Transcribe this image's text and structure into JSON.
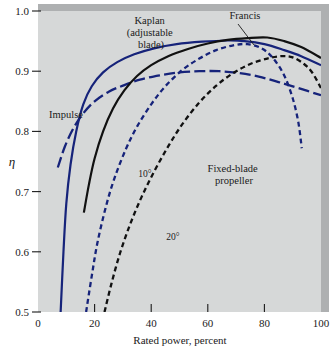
{
  "chart_data": {
    "type": "line",
    "title": "",
    "xlabel": "Rated power, percent",
    "ylabel": "η",
    "xlim": [
      0,
      100
    ],
    "ylim": [
      0.5,
      1.0
    ],
    "grid": false,
    "legend": "none",
    "xticks": [
      0,
      20,
      40,
      60,
      80,
      100
    ],
    "xtick_labels": [
      "0",
      "20",
      "40",
      "60",
      "80",
      "100"
    ],
    "yticks": [
      0.5,
      0.6,
      0.7,
      0.8,
      0.9,
      1.0
    ],
    "ytick_labels": [
      "0.5",
      "0.6",
      "0.7",
      "0.8",
      "0.9",
      "1.0"
    ],
    "series": [
      {
        "name": "Kaplan (adjustable blade)",
        "color": "#16237a",
        "style": "solid",
        "label_lines": [
          "Kaplan",
          "(adjustable",
          "blade)"
        ],
        "points": [
          [
            8.0,
            0.5
          ],
          [
            9.0,
            0.6
          ],
          [
            10.0,
            0.68
          ],
          [
            11.5,
            0.745
          ],
          [
            13.5,
            0.8
          ],
          [
            16.0,
            0.845
          ],
          [
            19.0,
            0.875
          ],
          [
            23.0,
            0.898
          ],
          [
            28.0,
            0.915
          ],
          [
            34.0,
            0.928
          ],
          [
            41.0,
            0.938
          ],
          [
            49.0,
            0.945
          ],
          [
            58.0,
            0.949
          ],
          [
            67.0,
            0.951
          ],
          [
            73.0,
            0.95
          ],
          [
            80.0,
            0.945
          ],
          [
            87.0,
            0.935
          ],
          [
            93.0,
            0.925
          ],
          [
            100.0,
            0.91
          ]
        ]
      },
      {
        "name": "Francis",
        "color": "#111111",
        "style": "solid",
        "label_lines": [
          "Francis"
        ],
        "points": [
          [
            16.2,
            0.665
          ],
          [
            18.0,
            0.712
          ],
          [
            20.0,
            0.755
          ],
          [
            23.0,
            0.8
          ],
          [
            26.5,
            0.838
          ],
          [
            30.5,
            0.868
          ],
          [
            35.0,
            0.892
          ],
          [
            40.0,
            0.91
          ],
          [
            46.0,
            0.925
          ],
          [
            53.0,
            0.937
          ],
          [
            60.0,
            0.946
          ],
          [
            67.0,
            0.952
          ],
          [
            74.0,
            0.955
          ],
          [
            81.0,
            0.956
          ],
          [
            87.0,
            0.95
          ],
          [
            93.0,
            0.94
          ],
          [
            100.0,
            0.922
          ]
        ]
      },
      {
        "name": "Impulse",
        "color": "#16237a",
        "style": "dash-long",
        "label_lines": [
          "Impulse"
        ],
        "points": [
          [
            7.0,
            0.74
          ],
          [
            9.5,
            0.775
          ],
          [
            12.5,
            0.805
          ],
          [
            16.0,
            0.83
          ],
          [
            20.0,
            0.85
          ],
          [
            25.0,
            0.866
          ],
          [
            30.0,
            0.876
          ],
          [
            36.0,
            0.886
          ],
          [
            43.0,
            0.893
          ],
          [
            50.0,
            0.898
          ],
          [
            57.0,
            0.9
          ],
          [
            64.0,
            0.9
          ],
          [
            71.0,
            0.897
          ],
          [
            78.0,
            0.891
          ],
          [
            85.0,
            0.882
          ],
          [
            92.0,
            0.872
          ],
          [
            100.0,
            0.86
          ]
        ]
      },
      {
        "name": "10°",
        "color": "#16237a",
        "style": "dash-short",
        "label_lines": [
          "10°"
        ],
        "points": [
          [
            17.0,
            0.5
          ],
          [
            19.0,
            0.56
          ],
          [
            21.0,
            0.615
          ],
          [
            24.0,
            0.675
          ],
          [
            27.0,
            0.722
          ],
          [
            31.0,
            0.77
          ],
          [
            35.0,
            0.808
          ],
          [
            40.0,
            0.845
          ],
          [
            45.0,
            0.875
          ],
          [
            51.0,
            0.902
          ],
          [
            57.0,
            0.921
          ],
          [
            63.0,
            0.935
          ],
          [
            69.0,
            0.943
          ],
          [
            74.0,
            0.945
          ],
          [
            79.0,
            0.938
          ],
          [
            83.0,
            0.922
          ],
          [
            87.0,
            0.893
          ],
          [
            90.0,
            0.855
          ],
          [
            92.0,
            0.815
          ],
          [
            93.2,
            0.772
          ]
        ]
      },
      {
        "name": "Fixed-blade propeller (20°)",
        "color": "#111111",
        "style": "dash-short",
        "label_lines": [
          "Fixed-blade",
          "propeller"
        ],
        "secondary_label": "20°",
        "points": [
          [
            23.5,
            0.5
          ],
          [
            26.0,
            0.548
          ],
          [
            29.0,
            0.598
          ],
          [
            32.5,
            0.645
          ],
          [
            36.5,
            0.69
          ],
          [
            41.0,
            0.733
          ],
          [
            46.0,
            0.775
          ],
          [
            51.0,
            0.812
          ],
          [
            57.0,
            0.848
          ],
          [
            63.0,
            0.876
          ],
          [
            69.0,
            0.897
          ],
          [
            75.0,
            0.912
          ],
          [
            81.0,
            0.921
          ],
          [
            86.0,
            0.925
          ],
          [
            90.0,
            0.923
          ],
          [
            94.0,
            0.912
          ],
          [
            97.0,
            0.897
          ],
          [
            100.0,
            0.872
          ]
        ]
      }
    ],
    "annotations": [
      {
        "name": "kaplan-label",
        "text_lines": [
          "Kaplan",
          "(adjustable",
          "blade)"
        ],
        "x_px": 151,
        "y_px": 24
      },
      {
        "name": "francis-label",
        "text_lines": [
          "Francis"
        ],
        "x_px": 245,
        "y_px": 17,
        "leader": {
          "x1": 238,
          "y1": 23,
          "x2": 253,
          "y2": 44
        }
      },
      {
        "name": "impulse-label",
        "text_lines": [
          "Impulse"
        ],
        "x_px": 66,
        "y_px": 115
      },
      {
        "name": "ten-degree-label",
        "text_lines": [
          "10°"
        ],
        "x_px": 145,
        "y_px": 174
      },
      {
        "name": "twenty-degree-label",
        "text_lines": [
          "20°"
        ],
        "x_px": 173,
        "y_px": 237
      },
      {
        "name": "fixed-blade-propeller-label",
        "text_lines": [
          "Fixed-blade",
          "propeller"
        ],
        "x_px": 228,
        "y_px": 172
      }
    ],
    "colors": {
      "plot_background": "#d4d6d6",
      "page_background": "#ffffff",
      "blue_curve": "#16237a",
      "black_curve": "#111111",
      "border_shadow": "#a8aaab",
      "text": "#1a1a1a"
    }
  }
}
